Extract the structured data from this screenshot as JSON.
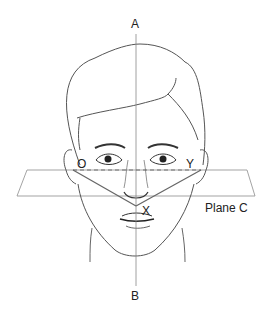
{
  "diagram": {
    "labels": {
      "top_axis": "A",
      "bottom_axis": "B",
      "left_point": "O",
      "right_point": "Y",
      "center_point": "X",
      "plane": "Plane C"
    },
    "colors": {
      "line": "#555555",
      "axis": "#888888",
      "plane": "#999999",
      "text": "#222222"
    }
  }
}
